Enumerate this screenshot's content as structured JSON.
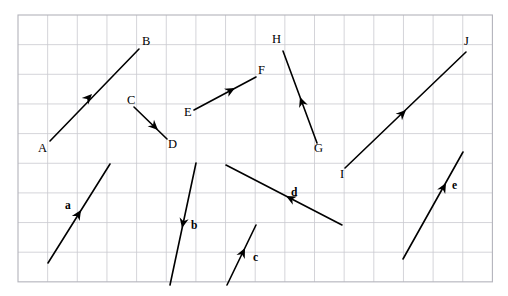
{
  "figure": {
    "kind": "vector-diagram",
    "width": 508,
    "height": 296,
    "background_color": "#ffffff"
  },
  "grid": {
    "x0": 18,
    "y0": 15,
    "cell": 29.65,
    "cols": 16,
    "rows": 9,
    "line_color": "#c9c9cf",
    "border_color": "#b3b3bb"
  },
  "style": {
    "vector_color": "#000000",
    "label_color": "#000000"
  },
  "point_labels": [
    {
      "text": "A",
      "x": 38,
      "y": 152,
      "name": "point-label-a"
    },
    {
      "text": "B",
      "x": 142,
      "y": 45,
      "name": "point-label-b"
    },
    {
      "text": "C",
      "x": 127,
      "y": 104,
      "name": "point-label-c"
    },
    {
      "text": "D",
      "x": 168,
      "y": 148,
      "name": "point-label-d"
    },
    {
      "text": "E",
      "x": 184,
      "y": 116,
      "name": "point-label-e"
    },
    {
      "text": "F",
      "x": 258,
      "y": 74,
      "name": "point-label-f"
    },
    {
      "text": "G",
      "x": 314,
      "y": 152,
      "name": "point-label-g"
    },
    {
      "text": "H",
      "x": 272,
      "y": 43,
      "name": "point-label-h"
    },
    {
      "text": "I",
      "x": 340,
      "y": 178,
      "name": "point-label-i"
    },
    {
      "text": "J",
      "x": 464,
      "y": 45,
      "name": "point-label-j"
    }
  ],
  "vector_labels": [
    {
      "text": "a",
      "x": 65,
      "y": 209,
      "name": "vector-label-a"
    },
    {
      "text": "b",
      "x": 191,
      "y": 229,
      "name": "vector-label-b"
    },
    {
      "text": "c",
      "x": 253,
      "y": 261,
      "name": "vector-label-c"
    },
    {
      "text": "d",
      "x": 291,
      "y": 196,
      "name": "vector-label-d"
    },
    {
      "text": "e",
      "x": 452,
      "y": 189,
      "name": "vector-label-e"
    }
  ],
  "vectors": [
    {
      "id": "AB",
      "name": "vector-ab",
      "tail": {
        "x": 50,
        "y": 141
      },
      "tip": {
        "x": 139,
        "y": 49
      },
      "head_at": {
        "x": 92,
        "y": 94
      },
      "head_angle_deg": -46,
      "direction": "up-right"
    },
    {
      "id": "CD",
      "name": "vector-cd",
      "tail": {
        "x": 134,
        "y": 107
      },
      "tip": {
        "x": 167,
        "y": 139
      },
      "head_at": {
        "x": 158,
        "y": 130
      },
      "head_angle_deg": 44,
      "direction": "down-right"
    },
    {
      "id": "EF",
      "name": "vector-ef",
      "tail": {
        "x": 194,
        "y": 110
      },
      "tip": {
        "x": 256,
        "y": 77
      },
      "head_at": {
        "x": 235,
        "y": 88
      },
      "head_angle_deg": -28,
      "direction": "up-right"
    },
    {
      "id": "GH",
      "name": "vector-gh",
      "tail": {
        "x": 317,
        "y": 143
      },
      "tip": {
        "x": 283,
        "y": 51
      },
      "head_at": {
        "x": 300,
        "y": 97
      },
      "head_angle_deg": -110,
      "direction": "up-left"
    },
    {
      "id": "IJ",
      "name": "vector-ij",
      "tail": {
        "x": 345,
        "y": 168
      },
      "tip": {
        "x": 466,
        "y": 52
      },
      "head_at": {
        "x": 406,
        "y": 110
      },
      "head_angle_deg": -44,
      "direction": "up-right"
    },
    {
      "id": "a",
      "name": "vector-a",
      "tail": {
        "x": 48,
        "y": 263
      },
      "tip": {
        "x": 110,
        "y": 164
      },
      "head_at": {
        "x": 81,
        "y": 210
      },
      "head_angle_deg": -58,
      "direction": "up-right"
    },
    {
      "id": "b",
      "name": "vector-b",
      "tail": {
        "x": 196,
        "y": 163
      },
      "tip": {
        "x": 170,
        "y": 285
      },
      "head_at": {
        "x": 182,
        "y": 228
      },
      "head_angle_deg": 102,
      "direction": "down-left"
    },
    {
      "id": "c",
      "name": "vector-c",
      "tail": {
        "x": 227,
        "y": 285
      },
      "tip": {
        "x": 256,
        "y": 225
      },
      "head_at": {
        "x": 245,
        "y": 248
      },
      "head_angle_deg": -64,
      "direction": "up-right"
    },
    {
      "id": "d",
      "name": "vector-d",
      "tail": {
        "x": 342,
        "y": 225
      },
      "tip": {
        "x": 226,
        "y": 165
      },
      "head_at": {
        "x": 286,
        "y": 196
      },
      "head_angle_deg": -153,
      "direction": "up-left"
    },
    {
      "id": "e",
      "name": "vector-e",
      "tail": {
        "x": 403,
        "y": 259
      },
      "tip": {
        "x": 463,
        "y": 152
      },
      "head_at": {
        "x": 446,
        "y": 183
      },
      "head_angle_deg": -61,
      "direction": "up-right"
    }
  ]
}
